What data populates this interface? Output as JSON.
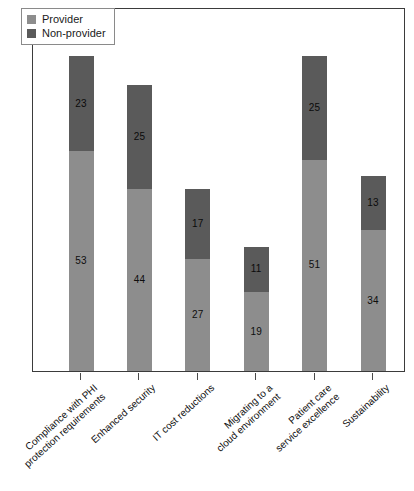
{
  "chart_data": {
    "type": "bar",
    "subtype": "stacked-bar",
    "title": "",
    "xlabel": "",
    "ylabel": "",
    "grid": false,
    "ylim": [
      0,
      76
    ],
    "legend_position": "top-left",
    "categories": [
      "Compliance with PHI\nprotection requirements",
      "Enhanced security",
      "IT cost reductions",
      "Migrating to a\ncloud environment",
      "Patient care\nservice excellence",
      "Sustainability"
    ],
    "series": [
      {
        "name": "Provider",
        "color": "#8d8d8d",
        "values": [
          53,
          44,
          27,
          19,
          51,
          34
        ]
      },
      {
        "name": "Non-provider",
        "color": "#5a5a5a",
        "values": [
          23,
          25,
          17,
          11,
          25,
          13
        ]
      }
    ],
    "totals": [
      76,
      69,
      44,
      30,
      76,
      47
    ]
  },
  "legend": {
    "items": [
      {
        "label": "Provider",
        "color": "#8d8d8d"
      },
      {
        "label": "Non-provider",
        "color": "#5a5a5a"
      }
    ]
  },
  "colors": {
    "provider": "#8d8d8d",
    "non_provider": "#5a5a5a",
    "frame": "#3b3b3b",
    "background": "#ffffff"
  }
}
